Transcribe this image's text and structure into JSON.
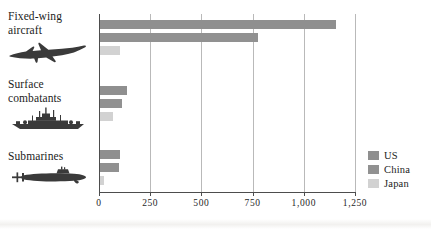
{
  "chart_data": {
    "type": "bar",
    "orientation": "horizontal",
    "title": "",
    "xlabel": "",
    "ylabel": "",
    "categories": [
      "Fixed-wing aircraft",
      "Surface combatants",
      "Submarines"
    ],
    "series": [
      {
        "name": "US",
        "color": "#8f8f8f",
        "values": [
          1150,
          130,
          100
        ]
      },
      {
        "name": "China",
        "color": "#919191",
        "values": [
          770,
          105,
          95
        ]
      },
      {
        "name": "Japan",
        "color": "#d2d2d2",
        "values": [
          100,
          65,
          20
        ]
      }
    ],
    "xlim": [
      0,
      1250
    ],
    "xticks": [
      0,
      250,
      500,
      750,
      1000,
      1250
    ],
    "xtick_labels": [
      "0",
      "250",
      "500",
      "750",
      "1,000",
      "1,250"
    ],
    "grid": true,
    "legend_position": "bottom-right"
  },
  "categories": [
    {
      "label_line1": "Fixed-wing",
      "label_line2": "aircraft",
      "icon": "fighter-jet-icon"
    },
    {
      "label_line1": "Surface",
      "label_line2": "combatants",
      "icon": "warship-icon"
    },
    {
      "label_line1": "Submarines",
      "label_line2": "",
      "icon": "submarine-icon"
    }
  ],
  "legend": {
    "items": [
      {
        "label": "US",
        "color": "#8f8f8f"
      },
      {
        "label": "China",
        "color": "#919191"
      },
      {
        "label": "Japan",
        "color": "#d2d2d2"
      }
    ]
  },
  "colors": {
    "axis": "#4d4d4d",
    "gridline": "#b9b9b9",
    "background": "#ffffff",
    "text": "#1c1c1c"
  }
}
